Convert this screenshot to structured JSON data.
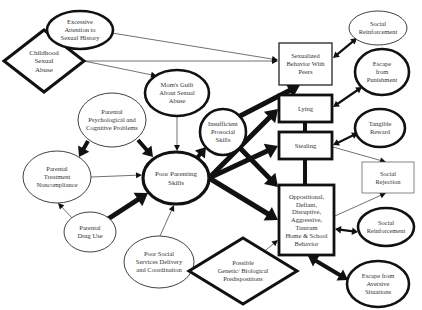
{
  "diagram": {
    "colors": {
      "stroke": "#111111",
      "text": "#333333",
      "background": "#ffffff"
    },
    "nodes": [
      {
        "id": "childhood-sexual-abuse",
        "shape": "diamond",
        "cx": 44,
        "cy": 61,
        "w": 80,
        "h": 62,
        "sw": 3,
        "fs": 7,
        "lines": [
          "Childhood",
          "Sexual",
          "Abuse"
        ]
      },
      {
        "id": "excessive-attention",
        "shape": "ellipse",
        "cx": 80,
        "cy": 30,
        "rx": 33,
        "ry": 19,
        "sw": 2.6,
        "fs": 6.5,
        "lines": [
          "Excessive",
          "Attention to",
          "Sexual History"
        ]
      },
      {
        "id": "moms-guilt",
        "shape": "ellipse",
        "cx": 177,
        "cy": 93,
        "rx": 32,
        "ry": 23,
        "sw": 2.6,
        "fs": 6.5,
        "lines": [
          "Mom's Guilt",
          "About Sexual",
          "Abuse"
        ]
      },
      {
        "id": "parental-psych",
        "shape": "ellipse",
        "cx": 112,
        "cy": 120,
        "rx": 34,
        "ry": 27,
        "sw": 0.8,
        "fs": 6.5,
        "lines": [
          "Parental",
          "Psychological and",
          "Cognitive Problems"
        ]
      },
      {
        "id": "insufficient-prosocial",
        "shape": "ellipse",
        "cx": 223,
        "cy": 132,
        "rx": 23,
        "ry": 23,
        "sw": 2.6,
        "fs": 6.5,
        "lines": [
          "Insufficient",
          "Prosocial",
          "Skills"
        ]
      },
      {
        "id": "parental-treatment",
        "shape": "ellipse",
        "cx": 57,
        "cy": 177,
        "rx": 34,
        "ry": 26,
        "sw": 0.8,
        "fs": 6.5,
        "lines": [
          "Parental",
          "Treatment",
          "Noncompliance"
        ]
      },
      {
        "id": "poor-parenting",
        "shape": "ellipse",
        "cx": 176,
        "cy": 178,
        "rx": 33,
        "ry": 26,
        "sw": 3.2,
        "fs": 7,
        "lines": [
          "Poor Parenting",
          "Skills"
        ]
      },
      {
        "id": "parental-drug",
        "shape": "ellipse",
        "cx": 90,
        "cy": 232,
        "rx": 26,
        "ry": 20,
        "sw": 0.8,
        "fs": 6.5,
        "lines": [
          "Parental",
          "Drug Use"
        ]
      },
      {
        "id": "poor-social-services",
        "shape": "ellipse",
        "cx": 159,
        "cy": 262,
        "rx": 35,
        "ry": 26,
        "sw": 0.8,
        "fs": 6.5,
        "lines": [
          "Poor Social",
          "Services Delivery",
          "and Coordination"
        ]
      },
      {
        "id": "genetic",
        "shape": "diamond",
        "cx": 243,
        "cy": 271,
        "w": 108,
        "h": 66,
        "sw": 3,
        "fs": 6.5,
        "lines": [
          "Possible",
          "Genetic/ Biological",
          "Predispositions"
        ]
      },
      {
        "id": "sexualized-behavior",
        "shape": "rect",
        "x": 279,
        "y": 43,
        "w": 53,
        "h": 42,
        "sw": 1.2,
        "fs": 6.5,
        "lines": [
          "Sexualized",
          "Behavior With",
          "Peers"
        ]
      },
      {
        "id": "lying",
        "shape": "rect",
        "x": 279,
        "y": 95,
        "w": 53,
        "h": 27,
        "sw": 2.8,
        "fs": 6.5,
        "lines": [
          "Lying"
        ]
      },
      {
        "id": "stealing",
        "shape": "rect",
        "x": 279,
        "y": 132,
        "w": 53,
        "h": 27,
        "sw": 2.8,
        "fs": 6.5,
        "lines": [
          "Stealing"
        ]
      },
      {
        "id": "oppositional",
        "shape": "rect",
        "x": 279,
        "y": 185,
        "w": 55,
        "h": 70,
        "sw": 2.8,
        "fs": 6.5,
        "lines": [
          "Oppositional,",
          "Defiant,",
          "Disruptive,",
          "Aggressive,",
          "Tantrum",
          "Home & School",
          "Behavior"
        ]
      },
      {
        "id": "social-reinforcement-1",
        "shape": "ellipse",
        "cx": 378,
        "cy": 28,
        "rx": 29,
        "ry": 17,
        "sw": 0.8,
        "fs": 6.5,
        "lines": [
          "Social",
          "Reinforcement"
        ]
      },
      {
        "id": "escape-punishment",
        "shape": "ellipse",
        "cx": 382,
        "cy": 72,
        "rx": 27,
        "ry": 23,
        "sw": 2.6,
        "fs": 6.5,
        "lines": [
          "Escape",
          "from",
          "Punishment"
        ]
      },
      {
        "id": "tangible-reward",
        "shape": "ellipse",
        "cx": 380,
        "cy": 128,
        "rx": 25,
        "ry": 19,
        "sw": 2.6,
        "fs": 6.5,
        "lines": [
          "Tangible",
          "Reward"
        ]
      },
      {
        "id": "social-rejection",
        "shape": "rect",
        "x": 362,
        "y": 162,
        "w": 52,
        "h": 31,
        "sw": 0.8,
        "fs": 6.5,
        "lines": [
          "Social",
          "Rejection"
        ]
      },
      {
        "id": "social-reinforcement-2",
        "shape": "ellipse",
        "cx": 386,
        "cy": 227,
        "rx": 28,
        "ry": 19,
        "sw": 2.6,
        "fs": 6.5,
        "lines": [
          "Social",
          "Reinforcement"
        ]
      },
      {
        "id": "escape-aversive",
        "shape": "ellipse",
        "cx": 378,
        "cy": 284,
        "rx": 31,
        "ry": 23,
        "sw": 2.6,
        "fs": 6.5,
        "lines": [
          "Escape from",
          "Aversive",
          "Situations"
        ]
      }
    ],
    "edges": [
      {
        "from": "excessive-attention",
        "to": "sexualized-behavior",
        "x1": 112,
        "y1": 33,
        "x2": 278,
        "y2": 60,
        "w": 0.6,
        "type": "arrow"
      },
      {
        "from": "childhood-sexual-abuse",
        "to": "sexualized-behavior",
        "x1": 84,
        "y1": 61,
        "x2": 278,
        "y2": 61,
        "w": 0.6,
        "type": "arrow"
      },
      {
        "from": "childhood-sexual-abuse",
        "to": "moms-guilt",
        "x1": 84,
        "y1": 61,
        "x2": 157,
        "y2": 76,
        "w": 0.6,
        "type": "arrow"
      },
      {
        "from": "moms-guilt",
        "to": "poor-parenting",
        "x1": 177,
        "y1": 116,
        "x2": 177,
        "y2": 151,
        "w": 0.6,
        "type": "arrow"
      },
      {
        "from": "parental-psych",
        "to": "parental-treatment",
        "x1": 88,
        "y1": 141,
        "x2": 79,
        "y2": 157,
        "w": 4,
        "type": "arrow"
      },
      {
        "from": "parental-psych",
        "to": "poor-parenting",
        "x1": 138,
        "y1": 140,
        "x2": 153,
        "y2": 157,
        "w": 4,
        "type": "arrow"
      },
      {
        "from": "parental-treatment",
        "to": "poor-parenting",
        "x1": 91,
        "y1": 177,
        "x2": 142,
        "y2": 175,
        "w": 0.6,
        "type": "arrow"
      },
      {
        "from": "parental-drug",
        "to": "parental-treatment",
        "x1": 72,
        "y1": 218,
        "x2": 58,
        "y2": 203,
        "w": 0.6,
        "type": "arrow"
      },
      {
        "from": "parental-drug",
        "to": "poor-parenting",
        "x1": 108,
        "y1": 219,
        "x2": 148,
        "y2": 193,
        "w": 5,
        "type": "arrow"
      },
      {
        "from": "poor-social-services",
        "to": "poor-parenting",
        "x1": 160,
        "y1": 236,
        "x2": 174,
        "y2": 205,
        "w": 0.6,
        "type": "arrow"
      },
      {
        "from": "poor-parenting",
        "to": "insufficient-prosocial",
        "x1": 197,
        "y1": 158,
        "x2": 206,
        "y2": 147,
        "w": 4,
        "type": "arrow"
      },
      {
        "from": "insufficient-prosocial",
        "to": "sexualized-behavior",
        "x1": 240,
        "y1": 116,
        "x2": 300,
        "y2": 85,
        "w": 5,
        "type": "arrow"
      },
      {
        "from": "poor-parenting",
        "to": "lying",
        "x1": 209,
        "y1": 178,
        "x2": 278,
        "y2": 109,
        "w": 5,
        "type": "arrow"
      },
      {
        "from": "poor-parenting",
        "to": "stealing",
        "x1": 209,
        "y1": 178,
        "x2": 278,
        "y2": 146,
        "w": 5,
        "type": "arrow"
      },
      {
        "from": "poor-parenting",
        "to": "oppositional",
        "x1": 209,
        "y1": 178,
        "x2": 278,
        "y2": 220,
        "w": 5,
        "type": "arrow"
      },
      {
        "from": "insufficient-prosocial",
        "to": "oppositional",
        "x1": 240,
        "y1": 148,
        "x2": 278,
        "y2": 187,
        "w": 5,
        "type": "arrow"
      },
      {
        "from": "genetic",
        "to": "oppositional",
        "x1": 260,
        "y1": 255,
        "x2": 278,
        "y2": 240,
        "w": 0.6,
        "type": "arrow"
      },
      {
        "from": "lying",
        "to": "stealing",
        "x1": 305,
        "y1": 122,
        "x2": 305,
        "y2": 132,
        "w": 4,
        "type": "line"
      },
      {
        "from": "stealing",
        "to": "oppositional",
        "x1": 305,
        "y1": 159,
        "x2": 305,
        "y2": 185,
        "w": 4,
        "type": "line"
      },
      {
        "from": "sexualized-behavior",
        "to": "social-reinforcement-1",
        "x1": 333,
        "y1": 58,
        "x2": 357,
        "y2": 38,
        "w": 2.2,
        "type": "double"
      },
      {
        "from": "lying",
        "to": "escape-punishment",
        "x1": 333,
        "y1": 107,
        "x2": 362,
        "y2": 87,
        "w": 2.2,
        "type": "double"
      },
      {
        "from": "stealing",
        "to": "tangible-reward",
        "x1": 333,
        "y1": 145,
        "x2": 358,
        "y2": 133,
        "w": 2.2,
        "type": "double"
      },
      {
        "from": "stealing",
        "to": "social-rejection",
        "x1": 333,
        "y1": 147,
        "x2": 386,
        "y2": 162,
        "w": 0.6,
        "type": "arrow"
      },
      {
        "from": "oppositional",
        "to": "social-rejection",
        "x1": 335,
        "y1": 216,
        "x2": 386,
        "y2": 193,
        "w": 0.6,
        "type": "arrow"
      },
      {
        "from": "oppositional",
        "to": "social-reinforcement-2",
        "x1": 335,
        "y1": 229,
        "x2": 358,
        "y2": 232,
        "w": 2.4,
        "type": "double"
      },
      {
        "from": "oppositional",
        "to": "escape-aversive",
        "x1": 308,
        "y1": 256,
        "x2": 348,
        "y2": 280,
        "w": 4,
        "type": "double"
      }
    ]
  }
}
